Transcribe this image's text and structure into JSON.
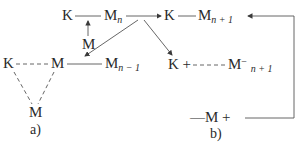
{
  "diagram": {
    "panel_a": {
      "caption": "a)",
      "nodes": {
        "top_K": "K",
        "top_Mn": "M",
        "top_Mn_sub": "n",
        "mid_M": "M",
        "row2_K": "K",
        "row2_M": "M",
        "row2_Mn1": "M",
        "row2_Mn1_sub": "n − 1",
        "bottom_M": "M"
      }
    },
    "panel_b": {
      "caption": "b)",
      "nodes": {
        "top_K": "K",
        "top_Mn1": "M",
        "top_Mn1_sub": "n + 1",
        "row2_K": "K +",
        "row2_M": "M",
        "row2_M_sup": "−",
        "row2_M_sub": "n + 1",
        "bottom": "—M +"
      }
    },
    "edges": [
      {
        "from": "K",
        "to": "M_n",
        "style": "solid"
      },
      {
        "from": "M",
        "to": "K—M_n",
        "style": "arrow-up"
      },
      {
        "from": "M_n",
        "to": "K (b)",
        "style": "arrow"
      },
      {
        "from": "M_n",
        "to": "M (a row2)",
        "style": "arrow"
      },
      {
        "from": "M_n",
        "to": "K + (b row2)",
        "style": "arrow"
      },
      {
        "from": "K (b)",
        "to": "M_n+1",
        "style": "solid"
      },
      {
        "from": "right loop",
        "to": "M_n+1",
        "style": "arrow"
      },
      {
        "from": "K (a row2)",
        "to": "M (a row2)",
        "style": "dashed"
      },
      {
        "from": "M (a row2)",
        "to": "M_n-1",
        "style": "solid"
      },
      {
        "from": "K (a row2)",
        "to": "M (bottom)",
        "style": "dashed"
      },
      {
        "from": "M (a row2)",
        "to": "M (bottom)",
        "style": "dashed"
      },
      {
        "from": "K + (b row2)",
        "to": "M⁻ n+1",
        "style": "dashed"
      },
      {
        "from": "—M +",
        "to": "right loop",
        "style": "solid"
      }
    ]
  }
}
